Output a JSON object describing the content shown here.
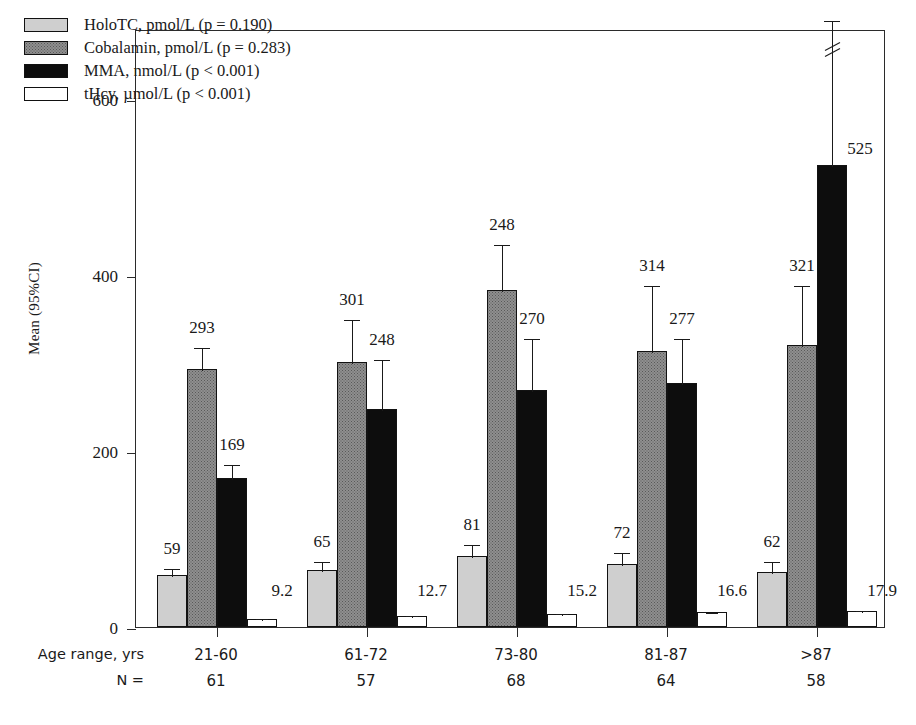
{
  "chart_data": {
    "type": "bar",
    "title": "",
    "xlabel": "Age range, yrs",
    "ylabel": "Mean (95%CI)",
    "ylim": [
      0,
      680
    ],
    "yticks": [
      0,
      200,
      400,
      600
    ],
    "grid": false,
    "legend_position": "top-left",
    "categories": [
      "21-60",
      "61-72",
      "73-80",
      "81-87",
      ">87"
    ],
    "group_n_label": "N =",
    "group_n": [
      "61",
      "57",
      "68",
      "64",
      "58"
    ],
    "series": [
      {
        "name": "HoloTC, pmol/L (p = 0.190)",
        "key": "holotc",
        "legend": "HoloTC, pmol/L (p = 0.190)",
        "color": "#cfcfcf",
        "values": [
          59,
          65,
          81,
          72,
          62
        ],
        "labels": [
          "59",
          "65",
          "81",
          "72",
          "62"
        ],
        "ci_upper": [
          68,
          76,
          96,
          86,
          76
        ],
        "ci_lower": [
          50,
          54,
          66,
          58,
          48
        ]
      },
      {
        "name": "Cobalamin, pmol/L (p = 0.283)",
        "key": "cobalamin",
        "legend": "Cobalamin, pmol/L (p = 0.283)",
        "color": "#8f8f8f",
        "values": [
          293,
          301,
          383,
          314,
          321
        ],
        "labels": [
          "293",
          "301",
          "248",
          "314",
          "321"
        ],
        "ci_upper": [
          320,
          351,
          437,
          390,
          390
        ],
        "ci_lower": [
          266,
          251,
          329,
          238,
          252
        ]
      },
      {
        "name": "MMA, nmol/L (p < 0.001)",
        "key": "mma",
        "legend": "MMA, nmol/L (p < 0.001)",
        "color": "#0d0d0d",
        "values": [
          169,
          248,
          270,
          277,
          525
        ],
        "labels": [
          "169",
          "248",
          "270",
          "277",
          "525"
        ],
        "ci_upper": [
          186,
          306,
          330,
          330,
          700
        ],
        "ci_lower": [
          152,
          190,
          210,
          224,
          350
        ],
        "broken_axis_index": 4
      },
      {
        "name": "tHcy, µmol/L (p < 0.001)",
        "key": "thcy",
        "legend": "tHcy, µmol/L (p < 0.001)",
        "color": "#ffffff",
        "values": [
          9.2,
          12.7,
          15.2,
          16.6,
          17.9
        ],
        "labels": [
          "9.2",
          "12.7",
          "15.2",
          "16.6",
          "17.9"
        ],
        "ci_upper": [
          11.0,
          14.5,
          17.0,
          18.6,
          20.5
        ],
        "ci_lower": [
          7.4,
          10.9,
          13.4,
          14.6,
          15.3
        ]
      }
    ]
  },
  "legend": {
    "items": [
      {
        "label": "HoloTC, pmol/L (p = 0.190)",
        "swatch": "holotc"
      },
      {
        "label": "Cobalamin, pmol/L (p = 0.283)",
        "swatch": "cobalamin"
      },
      {
        "label": "MMA, nmol/L (p < 0.001)",
        "swatch": "mma"
      },
      {
        "label": "tHcy, µmol/L (p < 0.001)",
        "swatch": "thcy"
      }
    ]
  },
  "axis": {
    "y_title": "Mean (95%CI)",
    "y_tick_labels": [
      "600",
      "400",
      "200",
      "0"
    ],
    "x_row_age_label": "Age range, yrs",
    "x_row_n_label": "N ="
  }
}
